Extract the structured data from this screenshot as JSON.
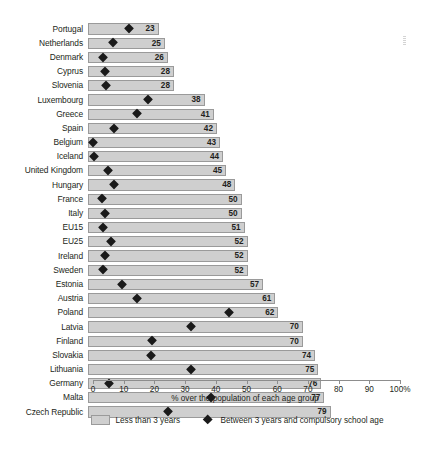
{
  "chart_data": {
    "type": "bar",
    "title": "",
    "subtitle": "",
    "xlabel": "% over the population of each age group",
    "ylabel": "",
    "xlim": [
      0,
      100
    ],
    "grid": false,
    "legend_position": "bottom",
    "categories": [
      "Portugal",
      "Netherlands",
      "Denmark",
      "Cyprus",
      "Slovenia",
      "Luxembourg",
      "Greece",
      "Spain",
      "Belgium",
      "Iceland",
      "United Kingdom",
      "Hungary",
      "France",
      "Italy",
      "EU15",
      "EU25",
      "Ireland",
      "Sweden",
      "Estonia",
      "Austria",
      "Poland",
      "Latvia",
      "Finland",
      "Slovakia",
      "Lithuania",
      "Germany",
      "Malta",
      "Czech Republic"
    ],
    "series": [
      {
        "name": "Less than 3 years",
        "type": "bar",
        "color": "#cfcfcf",
        "values": [
          23,
          25,
          26,
          28,
          28,
          38,
          41,
          42,
          43,
          44,
          45,
          48,
          50,
          50,
          51,
          52,
          52,
          52,
          57,
          61,
          62,
          70,
          70,
          74,
          75,
          76,
          77,
          79
        ]
      },
      {
        "name": "Between 3 years and compulsory school age",
        "type": "scatter",
        "marker": "diamond",
        "color": "#1a1a1a",
        "values": [
          13.5,
          8.0,
          5.0,
          5.5,
          6.0,
          19.5,
          16.0,
          8.5,
          1.5,
          2.0,
          6.5,
          8.5,
          4.5,
          5.5,
          5.0,
          7.5,
          5.5,
          5.0,
          11.0,
          16.0,
          46.0,
          33.5,
          21.0,
          20.5,
          33.5,
          7.0,
          40.0,
          26.0
        ]
      }
    ],
    "xticks": [
      0,
      10,
      20,
      30,
      40,
      50,
      60,
      70,
      80,
      90,
      100
    ],
    "xticklabels": [
      "0",
      "10",
      "20",
      "30",
      "40",
      "50",
      "60",
      "70",
      "80",
      "90",
      "100%"
    ],
    "bar_value_labels": [
      "23",
      "25",
      "26",
      "28",
      "28",
      "38",
      "41",
      "42",
      "43",
      "44",
      "45",
      "48",
      "50",
      "50",
      "51",
      "52",
      "52",
      "52",
      "57",
      "61",
      "62",
      "70",
      "70",
      "74",
      "75",
      "76",
      "77",
      "79"
    ]
  },
  "legend": {
    "items": [
      {
        "label": "Less than 3 years",
        "marker": "square-swatch"
      },
      {
        "label": "Between 3 years and compulsory school age",
        "marker": "diamond-marker"
      }
    ]
  },
  "axis": {
    "title": "% over the population of each age group"
  }
}
